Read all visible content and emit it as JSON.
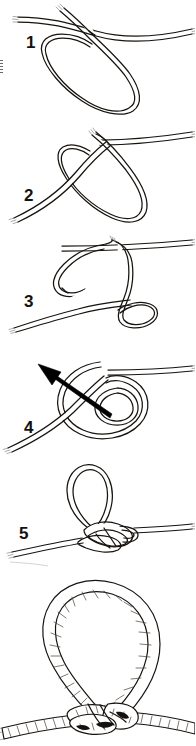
{
  "figure": {
    "kind": "line-art instructional diagram",
    "background_color": "#ffffff",
    "ink_color": "#17130f",
    "panel_count": 6
  },
  "steps": [
    {
      "number": "1",
      "label_x": 26,
      "label_y": 44,
      "caption": "Form a small overhand loop in the standing part of the rope",
      "style": "double-line rope"
    },
    {
      "number": "2",
      "label_x": 24,
      "label_y": 187,
      "caption": "Pass the working end up through the loop",
      "style": "double-line rope"
    },
    {
      "number": "3",
      "label_x": 24,
      "label_y": 293,
      "caption": "Bring the working end around behind the standing part",
      "style": "double-line rope"
    },
    {
      "number": "4",
      "label_x": 24,
      "label_y": 419,
      "caption": "Feed the end back down through the small loop",
      "style": "double-line rope with direction arrow"
    },
    {
      "number": "5",
      "label_x": 19,
      "label_y": 525,
      "caption": "Draw the knot up tight to set the bowline",
      "style": "double-line rope"
    },
    {
      "number": "",
      "label_x": 0,
      "label_y": 0,
      "caption": "Finished bowline with fixed loop, shown in textured rope",
      "style": "twisted strand rope"
    }
  ],
  "annotations": {
    "arrow": {
      "name": "pull-direction-arrow",
      "step": "4",
      "direction": "up-left",
      "color": "#000000"
    },
    "edge_artifact": {
      "name": "scan-edge-mark",
      "description": "faint partial ink mark at left page edge"
    }
  }
}
